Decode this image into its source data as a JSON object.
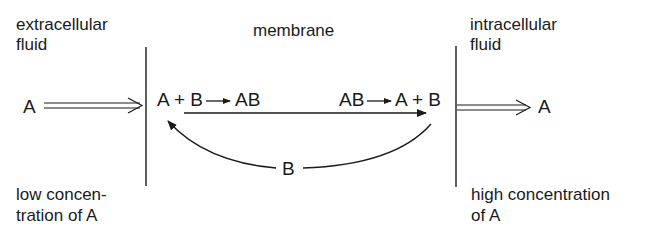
{
  "diagram": {
    "regions": {
      "extracellular": {
        "line1": "extracellular",
        "line2": "fluid"
      },
      "membrane": {
        "label": "membrane"
      },
      "intracellular": {
        "line1": "intracellular",
        "line2": "fluid"
      }
    },
    "left_species": "A",
    "right_species": "A",
    "left_reaction": "A + B → AB",
    "left_reaction_parts": {
      "reactants": "A + B",
      "product": "AB"
    },
    "right_reaction_parts": {
      "reactant": "AB",
      "products": "A + B"
    },
    "carrier_label": "B",
    "notes": {
      "left": {
        "line1": "low concen-",
        "line2": "tration of A"
      },
      "right": {
        "line1": "high concentration",
        "line2": "of A"
      }
    },
    "colors": {
      "ink": "#1a1a1a",
      "background": "#ffffff"
    }
  }
}
